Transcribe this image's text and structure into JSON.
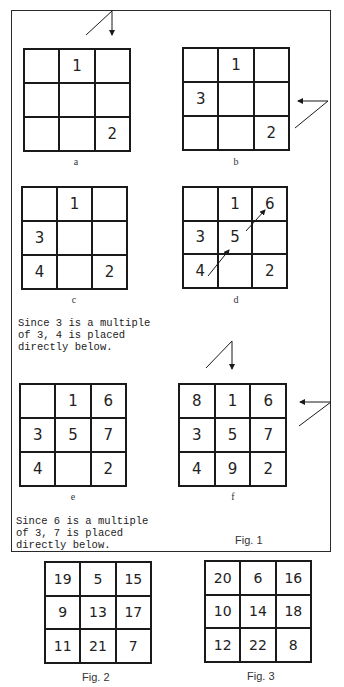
{
  "figure1": {
    "caption": "Fig. 1",
    "panels": [
      {
        "id": "a",
        "label": "a",
        "cells": [
          "",
          "1",
          "",
          "",
          "",
          "",
          "",
          "",
          "2"
        ]
      },
      {
        "id": "b",
        "label": "b",
        "cells": [
          "",
          "1",
          "",
          "3",
          "",
          "",
          "",
          "",
          "2"
        ]
      },
      {
        "id": "c",
        "label": "c",
        "cells": [
          "",
          "1",
          "",
          "3",
          "",
          "",
          "4",
          "",
          "2"
        ]
      },
      {
        "id": "d",
        "label": "d",
        "cells": [
          "",
          "1",
          "6",
          "3",
          "5",
          "",
          "4",
          "",
          "2"
        ]
      },
      {
        "id": "e",
        "label": "e",
        "cells": [
          "",
          "1",
          "6",
          "3",
          "5",
          "7",
          "4",
          "",
          "2"
        ]
      },
      {
        "id": "f",
        "label": "f",
        "cells": [
          "8",
          "1",
          "6",
          "3",
          "5",
          "7",
          "4",
          "9",
          "2"
        ]
      }
    ],
    "notes": [
      "Since 3 is a multiple\nof 3, 4 is placed\ndirectly below.",
      "Since 6 is a multiple\nof 3, 7 is placed\ndirectly below."
    ]
  },
  "figure2": {
    "caption": "Fig. 2",
    "cells": [
      "19",
      "5",
      "15",
      "9",
      "13",
      "17",
      "11",
      "21",
      "7"
    ]
  },
  "figure3": {
    "caption": "Fig. 3",
    "cells": [
      "20",
      "6",
      "16",
      "10",
      "14",
      "18",
      "12",
      "22",
      "8"
    ]
  },
  "colors": {
    "line": "#1a1a1a",
    "text": "#222222",
    "background": "#ffffff"
  }
}
